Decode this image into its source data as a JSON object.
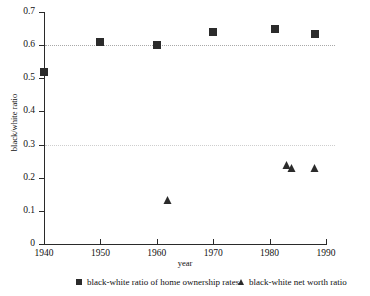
{
  "chart_data": {
    "type": "scatter",
    "title": "",
    "xlabel": "year",
    "ylabel": "black/white ratio",
    "xlim": [
      1940,
      1990
    ],
    "ylim": [
      0,
      0.7
    ],
    "grid": true,
    "gridlines_y": [
      0.6,
      0.3
    ],
    "legend_position": "bottom",
    "x_ticks": [
      {
        "value": 1940,
        "label": "1940"
      },
      {
        "value": 1950,
        "label": "1950"
      },
      {
        "value": 1960,
        "label": "1960"
      },
      {
        "value": 1970,
        "label": "1970"
      },
      {
        "value": 1980,
        "label": "1980"
      },
      {
        "value": 1990,
        "label": "1990"
      }
    ],
    "y_ticks": [
      {
        "value": 0.7,
        "label": "0.7"
      },
      {
        "value": 0.6,
        "label": "0.6"
      },
      {
        "value": 0.5,
        "label": "0.5"
      },
      {
        "value": 0.4,
        "label": "0.4"
      },
      {
        "value": 0.3,
        "label": "0.3"
      },
      {
        "value": 0.2,
        "label": "0.2"
      },
      {
        "value": 0.1,
        "label": "0.1"
      },
      {
        "value": 0.0,
        "label": "0"
      }
    ],
    "series": [
      {
        "name": "black-white ratio of home ownership rates",
        "marker": "square",
        "color": "#2b2b2b",
        "points": [
          {
            "x": 1940,
            "y": 0.52
          },
          {
            "x": 1950,
            "y": 0.61
          },
          {
            "x": 1960,
            "y": 0.6
          },
          {
            "x": 1970,
            "y": 0.64
          },
          {
            "x": 1981,
            "y": 0.65
          },
          {
            "x": 1988,
            "y": 0.635
          }
        ]
      },
      {
        "name": "black-white net worth ratio",
        "marker": "triangle",
        "color": "#2b2b2b",
        "points": [
          {
            "x": 1962,
            "y": 0.13
          },
          {
            "x": 1983,
            "y": 0.235
          },
          {
            "x": 1984,
            "y": 0.225
          },
          {
            "x": 1988,
            "y": 0.225
          }
        ]
      }
    ]
  },
  "legend": {
    "entries": [
      {
        "label": "black-white ratio of home ownership rates",
        "marker": "square"
      },
      {
        "label": "black-white net worth ratio",
        "marker": "triangle"
      }
    ]
  }
}
